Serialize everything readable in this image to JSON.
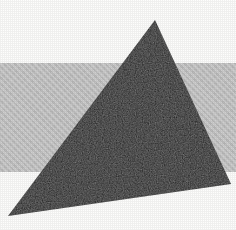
{
  "image": {
    "kind": "abstract-geometric-composition",
    "width": 236,
    "height": 230,
    "background_color": "#fdfdfc",
    "caption": ""
  },
  "palette": {
    "background": "#fdfdfc",
    "band_gray": "#c9c9c9",
    "triangle_dark": "#1b1b1b",
    "triangle_edge": "#101010"
  },
  "shapes": {
    "band": {
      "name": "horizontal-gray-band",
      "top": 63,
      "bottom": 172,
      "height": 109,
      "left": 0,
      "width": 236,
      "color": "#c9c9c9"
    },
    "triangle": {
      "name": "dark-triangle",
      "color": "#1b1b1b",
      "points": "155,20 231,184 8,216",
      "vertices": [
        {
          "label": "apex",
          "x": 155,
          "y": 20
        },
        {
          "label": "right",
          "x": 231,
          "y": 184
        },
        {
          "label": "bottom-left",
          "x": 8,
          "y": 216
        }
      ]
    }
  },
  "texture": {
    "grain_opacity": 0.055,
    "band_texture_opacity": 0.1
  }
}
